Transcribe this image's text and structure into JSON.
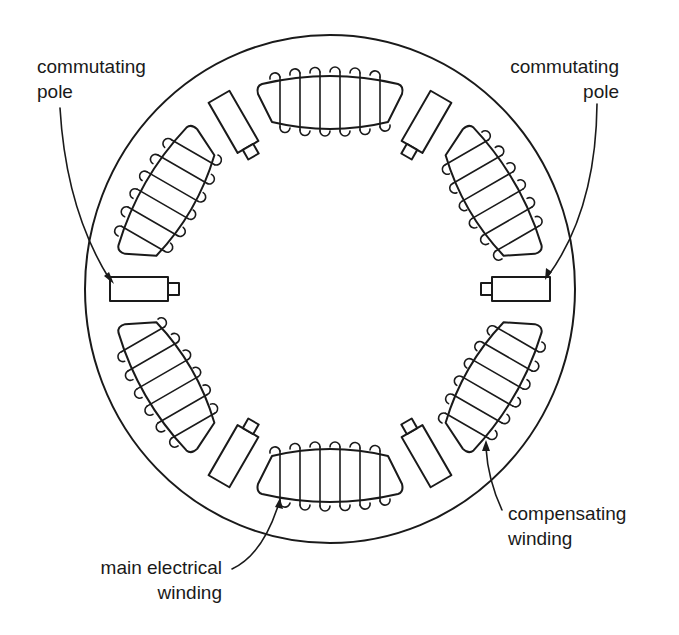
{
  "diagram": {
    "stator": {
      "cx": 330,
      "cy": 289,
      "rx": 245,
      "ry": 254
    },
    "main_poles": {
      "count": 6,
      "angles_deg": [
        0,
        60,
        120,
        180,
        240,
        300
      ],
      "radius": 191,
      "turns_per_pole": 6
    },
    "commutating_poles": {
      "count": 6,
      "angles_deg": [
        30,
        90,
        150,
        210,
        270,
        330
      ],
      "radius": 192
    },
    "stroke_color": "#1a1a1a",
    "background": "#ffffff"
  },
  "labels": {
    "commutating_pole_left": {
      "line1": "commutating",
      "line2": "pole"
    },
    "commutating_pole_right": {
      "line1": "commutating",
      "line2": "pole"
    },
    "main_electrical_winding": {
      "line1": "main electrical",
      "line2": "winding"
    },
    "compensating_winding": {
      "line1": "compensating",
      "line2": "winding"
    }
  }
}
